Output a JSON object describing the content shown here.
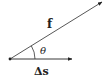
{
  "diagram": {
    "vectors": [
      {
        "id": "f",
        "label": "f",
        "from": [
          10,
          59
        ],
        "to": [
          102,
          2
        ]
      },
      {
        "id": "delta_s",
        "label": "Δs",
        "from": [
          10,
          59
        ],
        "to": [
          72,
          59
        ]
      }
    ],
    "angle": {
      "label": "θ",
      "between": [
        "f",
        "delta_s"
      ]
    },
    "origin": {
      "point": [
        10,
        59
      ]
    },
    "colors": {
      "stroke": "#222222",
      "background": "#ffffff"
    }
  }
}
